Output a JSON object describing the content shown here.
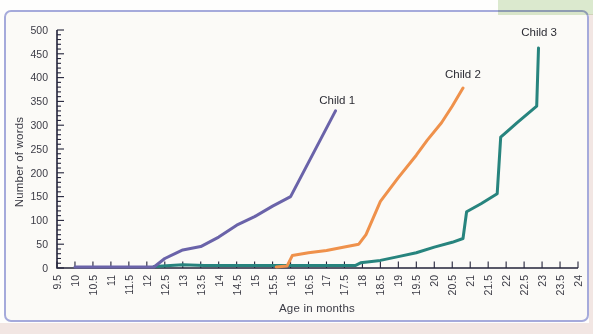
{
  "page": {
    "background_color": "#fefefd",
    "bottom_strip_color": "#f2e6e3",
    "highlight_color": "#dcead0",
    "chart_border_color": "#a5aadb",
    "chart_background_color": "#fbfaf7",
    "axis_color": "#23233a",
    "tick_label_color": "#3b3b45"
  },
  "chart_data": {
    "type": "line",
    "title": "",
    "xlabel": "Age in months",
    "ylabel": "Number of words",
    "xlim": [
      9.5,
      24
    ],
    "ylim": [
      0,
      500
    ],
    "grid": false,
    "legend": "inline-labels-at-line-ends",
    "x_ticks": [
      "9.5",
      "10",
      "10.5",
      "11",
      "11.5",
      "12",
      "12.5",
      "13",
      "13.5",
      "14",
      "14.5",
      "15",
      "15.5",
      "16",
      "16.5",
      "17",
      "17.5",
      "18",
      "18.5",
      "19",
      "19.5",
      "20",
      "20.5",
      "21",
      "21.5",
      "22",
      "22.5",
      "23",
      "23.5",
      "24"
    ],
    "y_ticks": [
      "0",
      "50",
      "100",
      "150",
      "200",
      "250",
      "300",
      "350",
      "400",
      "450",
      "500"
    ],
    "y_tick_minor_step": 10,
    "series": [
      {
        "name": "Child 1",
        "color": "#6a63a9",
        "label_anchor": [
          16.8,
          345
        ],
        "points": [
          [
            10,
            2
          ],
          [
            12.2,
            2
          ],
          [
            12.5,
            20
          ],
          [
            13,
            38
          ],
          [
            13.5,
            45
          ],
          [
            14,
            65
          ],
          [
            14.5,
            90
          ],
          [
            15,
            108
          ],
          [
            15.5,
            130
          ],
          [
            16,
            150
          ],
          [
            17.25,
            330
          ]
        ]
      },
      {
        "name": "Child 2",
        "color": "#ef914b",
        "label_anchor": [
          20.3,
          400
        ],
        "points": [
          [
            15.6,
            2
          ],
          [
            15.9,
            4
          ],
          [
            16.05,
            26
          ],
          [
            16.5,
            32
          ],
          [
            17,
            37
          ],
          [
            17.5,
            44
          ],
          [
            17.9,
            50
          ],
          [
            18.1,
            70
          ],
          [
            18.5,
            140
          ],
          [
            19,
            190
          ],
          [
            19.5,
            237
          ],
          [
            19.8,
            268
          ],
          [
            20.2,
            305
          ],
          [
            20.5,
            340
          ],
          [
            20.8,
            378
          ]
        ]
      },
      {
        "name": "Child 3",
        "color": "#27847e",
        "label_anchor": [
          22.42,
          487
        ],
        "points": [
          [
            12.2,
            3
          ],
          [
            13,
            7
          ],
          [
            13.6,
            5
          ],
          [
            17.8,
            5
          ],
          [
            17.95,
            11
          ],
          [
            18.5,
            16
          ],
          [
            19,
            24
          ],
          [
            19.5,
            32
          ],
          [
            20,
            44
          ],
          [
            20.5,
            54
          ],
          [
            20.8,
            62
          ],
          [
            20.9,
            118
          ],
          [
            21.3,
            135
          ],
          [
            21.75,
            156
          ],
          [
            21.85,
            275
          ],
          [
            22.3,
            305
          ],
          [
            22.85,
            340
          ],
          [
            22.9,
            462
          ]
        ]
      }
    ]
  }
}
